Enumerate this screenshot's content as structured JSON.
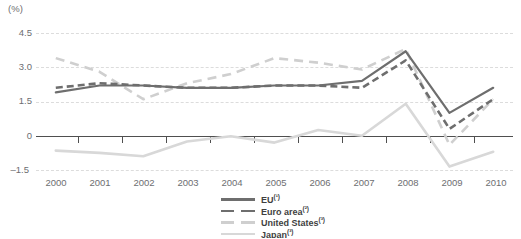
{
  "chart": {
    "unit_label": "(%)",
    "y_ticks": [
      "4.5",
      "3.0",
      "1.5",
      "0",
      "–1.5"
    ],
    "x_ticks": [
      "2000",
      "2001",
      "2002",
      "2003",
      "2004",
      "2005",
      "2006",
      "2007",
      "2008",
      "2009",
      "2010"
    ]
  },
  "legend": {
    "position": "bottom-center",
    "items": [
      {
        "label": "EU",
        "note": "(¹)",
        "color": "#6e6e6e",
        "style": "solid"
      },
      {
        "label": "Euro area",
        "note": "(²)",
        "color": "#6e6e6e",
        "style": "dashed"
      },
      {
        "label": "United States",
        "note": "(³)",
        "color": "#cfcfcf",
        "style": "dashed"
      },
      {
        "label": "Japan",
        "note": "(³)",
        "color": "#d8d8d8",
        "style": "solid"
      }
    ]
  },
  "chart_data": {
    "type": "line",
    "title": "",
    "subtitle": "",
    "xlabel": "",
    "ylabel": "(%)",
    "x": [
      2000,
      2001,
      2002,
      2003,
      2004,
      2005,
      2006,
      2007,
      2008,
      2009,
      2010
    ],
    "categories": [
      "2000",
      "2001",
      "2002",
      "2003",
      "2004",
      "2005",
      "2006",
      "2007",
      "2008",
      "2009",
      "2010"
    ],
    "ylim": [
      -1.5,
      4.5
    ],
    "yticks": [
      -1.5,
      0,
      1.5,
      3.0,
      4.5
    ],
    "grid": true,
    "grid_style": "dashed-horizontal",
    "legend_position": "bottom-center",
    "series": [
      {
        "name": "EU",
        "note": "(¹)",
        "color": "#6e6e6e",
        "style": "solid",
        "values": [
          1.9,
          2.2,
          2.2,
          2.1,
          2.1,
          2.2,
          2.2,
          2.4,
          3.7,
          1.0,
          2.1
        ]
      },
      {
        "name": "Euro area",
        "note": "(²)",
        "color": "#6e6e6e",
        "style": "dashed",
        "values": [
          2.1,
          2.3,
          2.2,
          2.1,
          2.1,
          2.2,
          2.2,
          2.1,
          3.3,
          0.3,
          1.6
        ]
      },
      {
        "name": "United States",
        "note": "(³)",
        "color": "#cfcfcf",
        "style": "dashed",
        "values": [
          3.4,
          2.8,
          1.6,
          2.3,
          2.7,
          3.4,
          3.2,
          2.9,
          3.8,
          -0.4,
          1.6
        ]
      },
      {
        "name": "Japan",
        "note": "(³)",
        "color": "#d8d8d8",
        "style": "solid",
        "values": [
          -0.65,
          -0.75,
          -0.9,
          -0.25,
          -0.02,
          -0.3,
          0.25,
          0.0,
          1.4,
          -1.35,
          -0.7
        ]
      }
    ]
  }
}
